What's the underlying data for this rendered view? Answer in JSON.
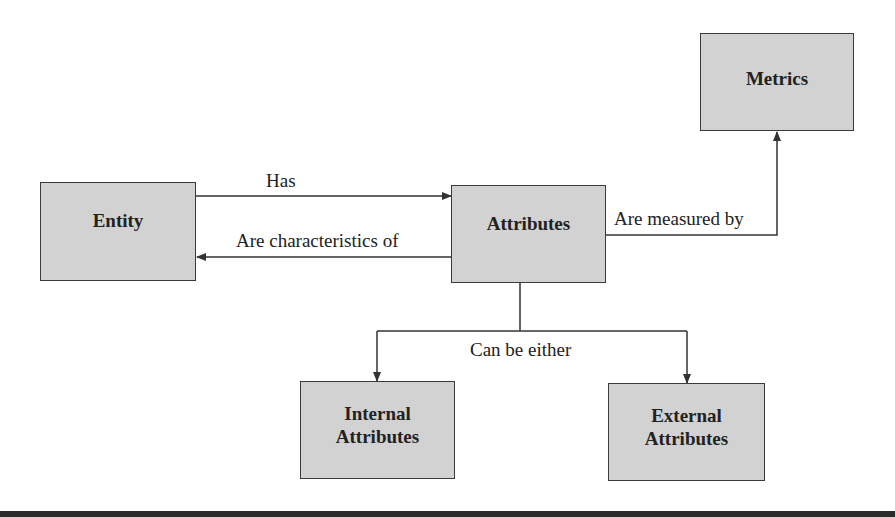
{
  "diagram": {
    "nodes": {
      "entity": {
        "label": "Entity"
      },
      "attributes": {
        "label": "Attributes"
      },
      "metrics": {
        "label": "Metrics"
      },
      "internal": {
        "line1": "Internal",
        "line2": "Attributes"
      },
      "external": {
        "line1": "External",
        "line2": "Attributes"
      }
    },
    "edges": {
      "has": "Has",
      "are_characteristics_of": "Are characteristics of",
      "are_measured_by": "Are measured by",
      "can_be_either": "Can be either"
    },
    "colors": {
      "box_fill": "#d2d2d2",
      "box_border": "#3a3a3a",
      "line": "#333333",
      "bottom_bar": "#2b2b2b"
    }
  }
}
